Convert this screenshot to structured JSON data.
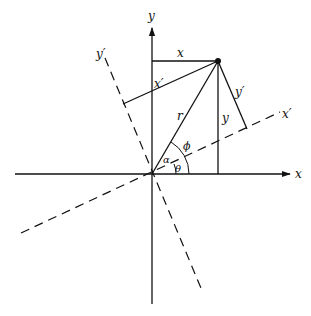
{
  "figure": {
    "labels": {
      "y_axis": "y",
      "x_axis": "x",
      "y_prime_axis": "y′",
      "x_prime_axis": "x′",
      "x_component": "x",
      "y_component": "y",
      "x_prime_component": "x′",
      "y_prime_component": "y′",
      "radius": "r",
      "angle_phi": "ϕ",
      "angle_alpha": "α",
      "angle_theta": "θ"
    },
    "colors": {
      "line": "#111111",
      "background": "#ffffff"
    }
  }
}
